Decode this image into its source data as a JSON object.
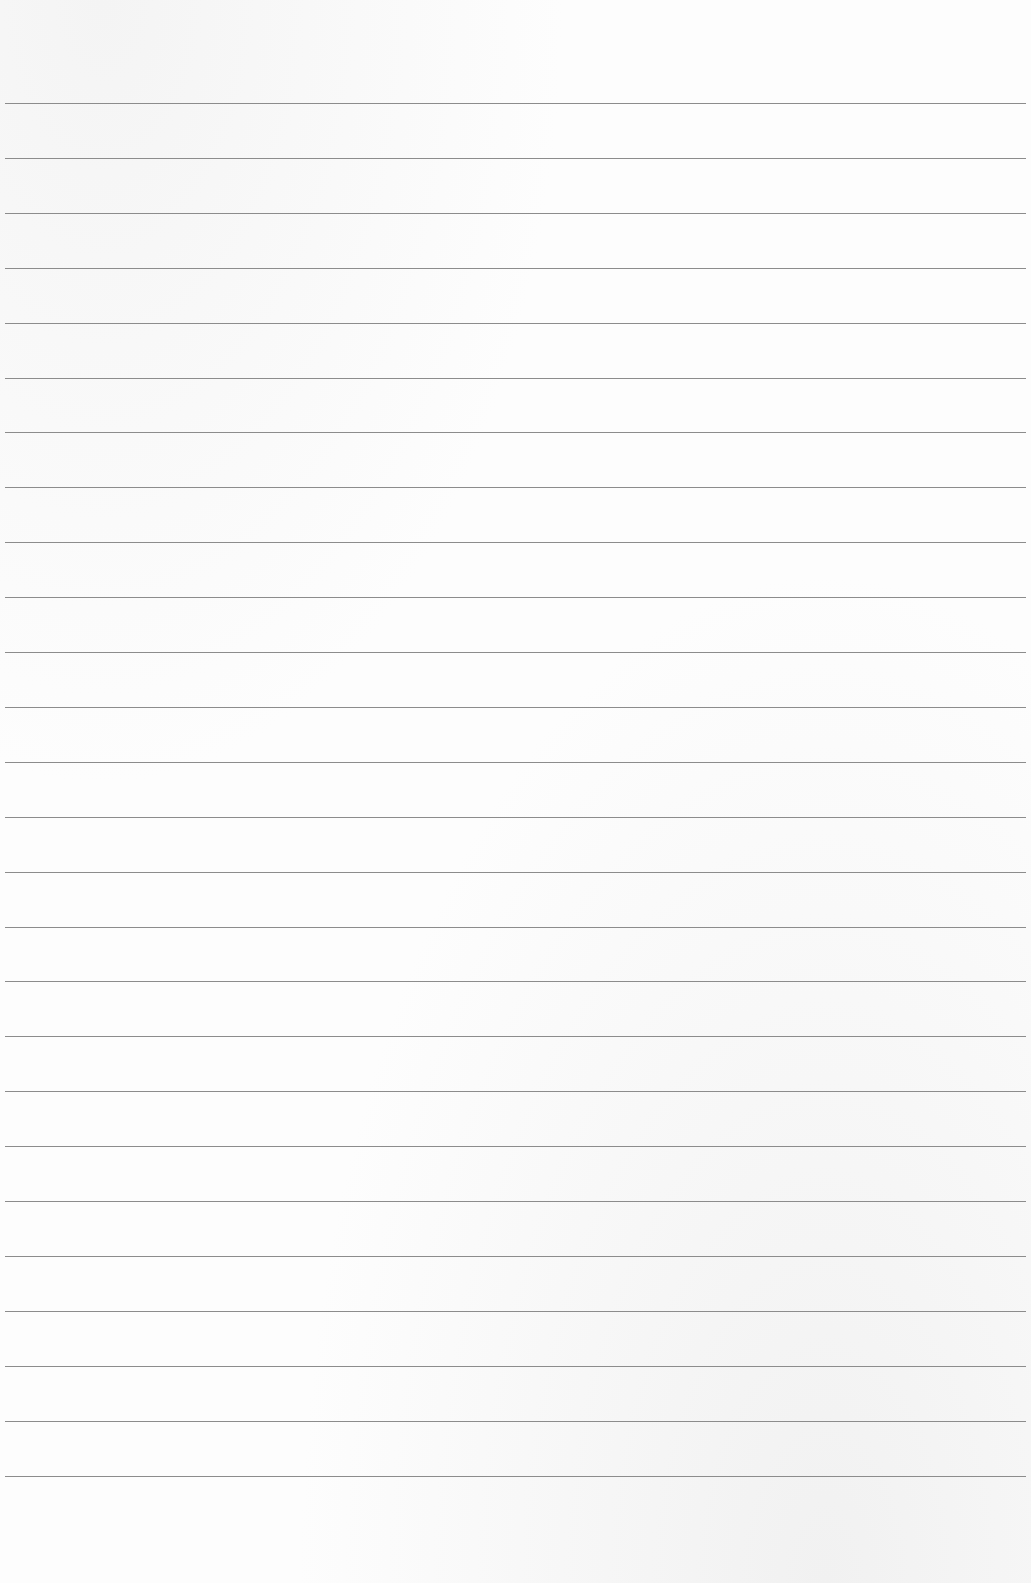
{
  "sheet": {
    "type": "lined-paper",
    "line_count": 26,
    "first_line_y": 103,
    "line_spacing": 54.9,
    "line_color": "#8c8c8c",
    "background_color": "#fdfdfd"
  }
}
